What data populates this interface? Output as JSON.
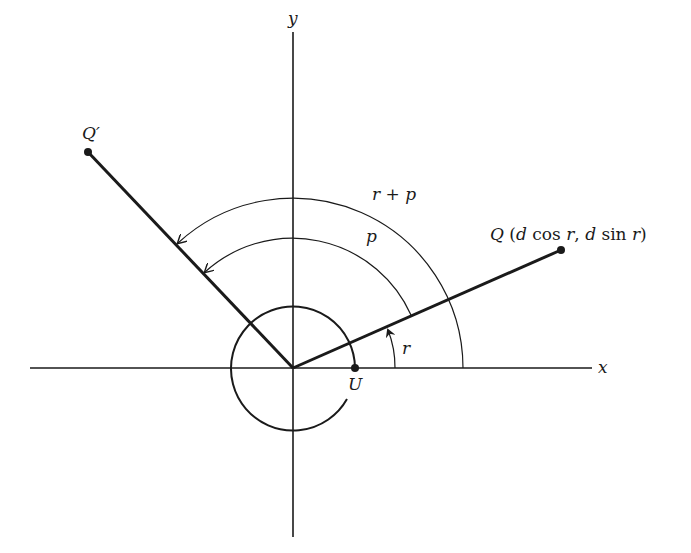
{
  "diagram": {
    "axes": {
      "x_label": "x",
      "y_label": "y"
    },
    "points": {
      "Q": {
        "label": "Q",
        "coords_text": "(d cos r, d sin r)",
        "coords_parts": [
          "(",
          "d",
          " cos ",
          "r",
          ", ",
          "d",
          " sin ",
          "r",
          ")"
        ]
      },
      "Q_prime": {
        "label": "Q′"
      },
      "U": {
        "label": "U"
      }
    },
    "angles": {
      "r": {
        "label": "r"
      },
      "p": {
        "label": "p"
      },
      "r_plus_p": {
        "label": "r + p",
        "parts": [
          "r",
          " + ",
          "p"
        ]
      }
    },
    "colors": {
      "ink": "#1a1a1a",
      "background": "#ffffff"
    }
  }
}
